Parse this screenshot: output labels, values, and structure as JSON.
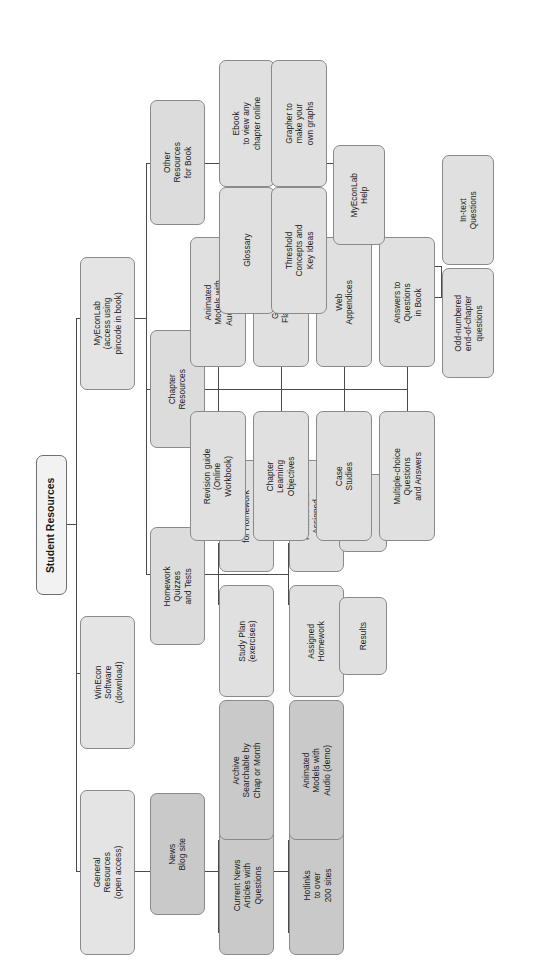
{
  "diagram": {
    "type": "organizational-tree",
    "orientation": "rotated-90-ccw",
    "title": "Student Resources",
    "colors": {
      "box_fill": "#e2e2e2",
      "box_fill_dark": "#c9c9c9",
      "root_fill": "#f2f2f2",
      "border": "#8a8a8a",
      "connector": "#4a4a4a",
      "text": "#1a1a1a",
      "page_background": "#ffffff"
    },
    "nodes": {
      "root": "Student Resources",
      "general_resources": "General\nResources\n(open access)",
      "winecon": "WinEcon\nSoftware\n(download)",
      "myeconlab": "MyEconLab\n(access using\npincode in book)",
      "news_blog": "News\nBlog site",
      "current_news": "Current News\nArticles with\nQuestions",
      "archive": "Archive\nSearchable by\nChap or Month",
      "hotlinks": "Hotlinks\nto over\n200 sites",
      "animated_demo": "Animated\nModels with\nAudio (demo)",
      "homework": "Homework\nQuizzes\nand Tests",
      "study_plan": "Study Plan\n(exercises)",
      "calendar": "Calendar\nfor Homework\nand Tests",
      "assigned_homework": "Assigned\nHomework",
      "practice_tests": "Practice and\nAssigned\nTests",
      "results_homework": "Results",
      "results_tests": "Results",
      "chapter_resources": "Chapter\nResources",
      "revision_guide": "Revision guide\n(Online\nWorkbook)",
      "animated_ipod": "Animated\nModels with\nAudio (iPod)",
      "chapter_objectives": "Chapter\nLearning\nObjectives",
      "glossary_flashcards": "Glossary\nFlashcards",
      "case_studies": "Case\nStudies",
      "web_appendices": "Web\nAppendices",
      "mcq": "Multiple-choice\nQuestions\nand Answers",
      "answers_to_questions": "Answers to\nQuestions\nin Book",
      "odd_numbered": "Odd-numbered\nend-of-chapter\nquestions",
      "in_text_questions": "In-text\nQuestions",
      "other_resources": "Other\nResources\nfor Book",
      "glossary": "Glossary",
      "ebook": "Ebook\nto view any\nchapter online",
      "threshold": "Threshold\nConcepts and\nKey Ideas",
      "grapher": "Grapher to\nmake your\nown graphs",
      "myeconlab_help": "MyEconLab\nHelp"
    },
    "hierarchy": [
      {
        "node": "Student Resources",
        "children": [
          "General Resources (open access)",
          "WinEcon Software (download)",
          "MyEconLab (access using pincode in book)"
        ]
      },
      {
        "node": "General Resources (open access)",
        "children": [
          "News Blog site"
        ]
      },
      {
        "node": "News Blog site",
        "children": [
          "Current News Articles with Questions",
          "Archive Searchable by Chap or Month",
          "Hotlinks to over 200 sites",
          "Animated Models with Audio (demo)"
        ]
      },
      {
        "node": "MyEconLab (access using pincode in book)",
        "children": [
          "Homework Quizzes and Tests",
          "Chapter Resources",
          "Other Resources for Book"
        ]
      },
      {
        "node": "Homework Quizzes and Tests",
        "children": [
          "Study Plan (exercises)",
          "Calendar for Homework and Tests",
          "Assigned Homework",
          "Practice and Assigned Tests"
        ]
      },
      {
        "node": "Assigned Homework",
        "children": [
          "Results"
        ]
      },
      {
        "node": "Practice and Assigned Tests",
        "children": [
          "Results"
        ]
      },
      {
        "node": "Chapter Resources",
        "children": [
          "Revision guide (Online Workbook)",
          "Animated Models with Audio (iPod)",
          "Chapter Learning Objectives",
          "Glossary Flashcards",
          "Case Studies",
          "Web Appendices",
          "Multiple-choice Questions and Answers",
          "Answers to Questions in Book"
        ]
      },
      {
        "node": "Answers to Questions in Book",
        "children": [
          "Odd-numbered end-of-chapter questions",
          "In-text Questions"
        ]
      },
      {
        "node": "Other Resources for Book",
        "children": [
          "Glossary",
          "Ebook to view any chapter online",
          "Threshold Concepts and Key Ideas",
          "Grapher to make your own graphs",
          "MyEconLab Help"
        ]
      }
    ]
  }
}
